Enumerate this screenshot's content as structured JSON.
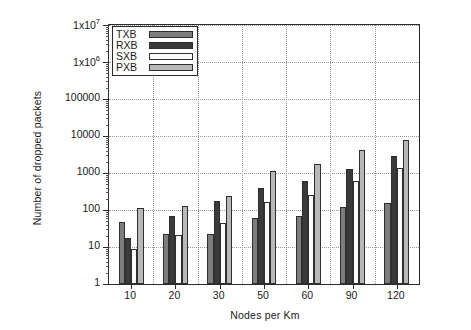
{
  "chart_data": {
    "type": "bar",
    "title": "",
    "xlabel": "Nodes per Km",
    "ylabel": "Number of dropped packets",
    "categories": [
      "10",
      "20",
      "30",
      "50",
      "60",
      "90",
      "120"
    ],
    "yscale": "log",
    "ylim": [
      1,
      10000000
    ],
    "ytick_labels": [
      "1",
      "10",
      "100",
      "1000",
      "10000",
      "100000",
      "1x10⁶",
      "1x10⁷"
    ],
    "ytick_values": [
      1,
      10,
      100,
      1000,
      10000,
      100000,
      1000000,
      10000000
    ],
    "ytick_mantissa": [
      "1",
      "10",
      "100",
      "1000",
      "10000",
      "100000",
      "1x10",
      "1x10"
    ],
    "ytick_exponent": [
      "",
      "",
      "",
      "",
      "",
      "",
      "6",
      "7"
    ],
    "grid": true,
    "legend_position": "top-left",
    "series": [
      {
        "name": "TXB",
        "color": "#7d7d7d",
        "values": [
          48,
          22,
          23,
          62,
          68,
          120,
          155
        ]
      },
      {
        "name": "RXB",
        "color": "#3a3a3a",
        "values": [
          17,
          70,
          180,
          400,
          600,
          1300,
          2800
        ]
      },
      {
        "name": "SXB",
        "color": "#fbfbfb",
        "values": [
          9,
          21,
          45,
          160,
          250,
          620,
          1400
        ]
      },
      {
        "name": "PXB",
        "color": "#b8b8b8",
        "values": [
          110,
          125,
          240,
          1100,
          1800,
          4200,
          7800
        ]
      }
    ]
  },
  "axes": {
    "xlabel": "Nodes per Km",
    "ylabel": "Number of dropped packets"
  }
}
